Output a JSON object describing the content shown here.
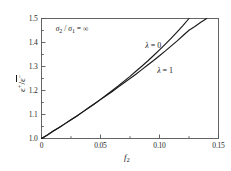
{
  "chart_data": {
    "type": "line",
    "title": "",
    "xlabel": "f2",
    "ylabel": "e+/e-",
    "xlim": [
      0,
      0.15
    ],
    "ylim": [
      1.0,
      1.5
    ],
    "grid": false,
    "legend_position": "inline-curve-labels",
    "annotations": [
      {
        "text": "sigma_2 / sigma_1 = infinity",
        "x": 0.012,
        "y": 1.455
      }
    ],
    "xticks": [
      0,
      0.05,
      0.1,
      0.15
    ],
    "xtick_labels": [
      "0",
      "0.05",
      "0.10",
      "0.15"
    ],
    "xminor_ticks": [
      0.025,
      0.075,
      0.125
    ],
    "yticks": [
      1.0,
      1.1,
      1.2,
      1.3,
      1.4,
      1.5
    ],
    "ytick_labels": [
      "1.0",
      "1.1",
      "1.2",
      "1.3",
      "1.4",
      "1.5"
    ],
    "yminor_ticks": [
      1.05,
      1.15,
      1.25,
      1.35,
      1.45
    ],
    "series": [
      {
        "name": "lambda = 0",
        "label_x": 0.088,
        "label_y": 1.385,
        "color": "#1a1a1a",
        "x": [
          0.0,
          0.005,
          0.01,
          0.015,
          0.02,
          0.025,
          0.03,
          0.035,
          0.04,
          0.045,
          0.05,
          0.055,
          0.06,
          0.065,
          0.07,
          0.075,
          0.08,
          0.085,
          0.09,
          0.095,
          0.1,
          0.105,
          0.11,
          0.115,
          0.12,
          0.125
        ],
        "values": [
          1.0,
          1.015,
          1.031,
          1.046,
          1.062,
          1.078,
          1.094,
          1.111,
          1.128,
          1.145,
          1.163,
          1.181,
          1.2,
          1.219,
          1.239,
          1.259,
          1.28,
          1.301,
          1.323,
          1.346,
          1.369,
          1.393,
          1.418,
          1.444,
          1.471,
          1.5
        ]
      },
      {
        "name": "lambda = 1",
        "label_x": 0.098,
        "label_y": 1.283,
        "color": "#1a1a1a",
        "x": [
          0.0,
          0.005,
          0.01,
          0.015,
          0.02,
          0.025,
          0.03,
          0.035,
          0.04,
          0.045,
          0.05,
          0.055,
          0.06,
          0.065,
          0.07,
          0.075,
          0.08,
          0.085,
          0.09,
          0.095,
          0.1,
          0.105,
          0.11,
          0.115,
          0.12,
          0.125,
          0.13,
          0.135,
          0.14
        ],
        "values": [
          1.0,
          1.015,
          1.031,
          1.046,
          1.062,
          1.078,
          1.094,
          1.111,
          1.128,
          1.145,
          1.162,
          1.179,
          1.196,
          1.214,
          1.232,
          1.25,
          1.268,
          1.287,
          1.306,
          1.325,
          1.345,
          1.365,
          1.386,
          1.407,
          1.429,
          1.451,
          1.467,
          1.484,
          1.5
        ]
      }
    ]
  },
  "axis": {
    "ylabel_num": "ε",
    "ylabel_den": "ε",
    "ylabel_num_sup": "+",
    "ylabel_den_sup": "−",
    "xlabel_main": "f",
    "xlabel_sub": "2"
  },
  "annotation": {
    "sigma_sym": "σ",
    "sub2": "2",
    "sub1": "1",
    "slash": " / ",
    "equals": " = ",
    "infinity": "∞"
  },
  "curve_labels": {
    "lambda_sym": "λ",
    "zero": "= 0",
    "one": "= 1"
  },
  "colors": {
    "curve": "#1a1a1a",
    "frame": "#555555",
    "text": "#1a1a1a",
    "background": "#ffffff"
  }
}
